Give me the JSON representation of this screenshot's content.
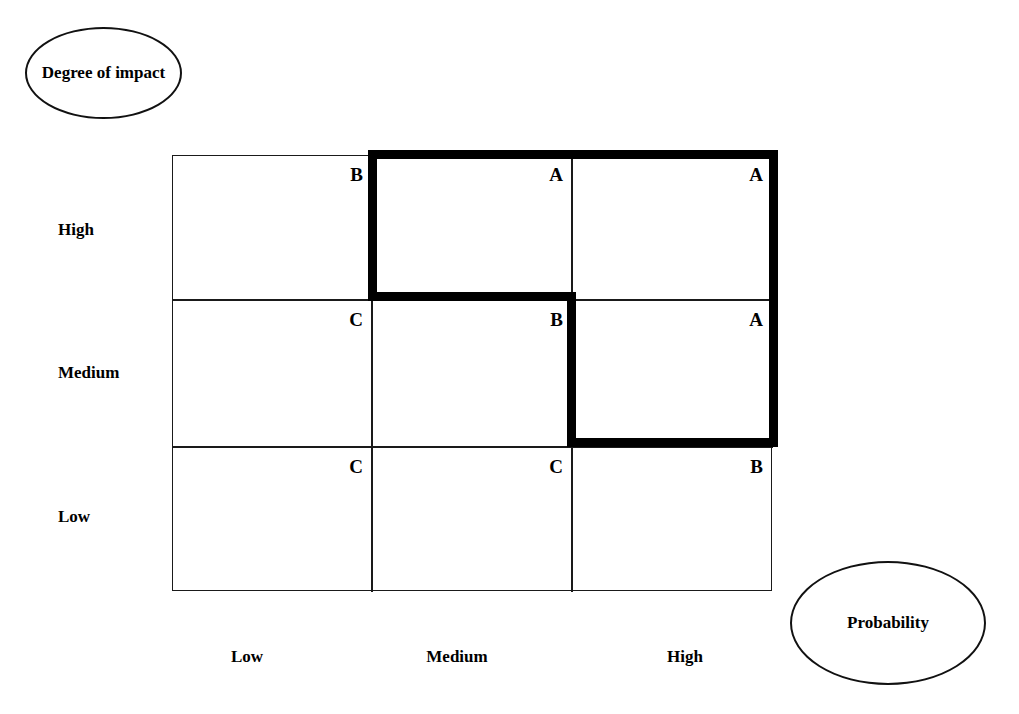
{
  "diagram": {
    "axes": {
      "y": {
        "name": "Degree of impact",
        "categories": [
          "High",
          "Medium",
          "Low"
        ]
      },
      "x": {
        "name": "Probability",
        "categories": [
          "Low",
          "Medium",
          "High"
        ]
      }
    },
    "ellipses": {
      "impact": "Degree of impact",
      "probability": "Probability"
    },
    "cells": [
      {
        "row": "High",
        "col": "Low",
        "rating": "B"
      },
      {
        "row": "High",
        "col": "Medium",
        "rating": "A"
      },
      {
        "row": "High",
        "col": "High",
        "rating": "A"
      },
      {
        "row": "Medium",
        "col": "Low",
        "rating": "C"
      },
      {
        "row": "Medium",
        "col": "Medium",
        "rating": "B"
      },
      {
        "row": "Medium",
        "col": "High",
        "rating": "A"
      },
      {
        "row": "Low",
        "col": "Low",
        "rating": "C"
      },
      {
        "row": "Low",
        "col": "Medium",
        "rating": "C"
      },
      {
        "row": "Low",
        "col": "High",
        "rating": "B"
      }
    ],
    "row_labels": [
      "High",
      "Medium",
      "Low"
    ],
    "col_labels": [
      "Low",
      "Medium",
      "High"
    ],
    "colors": {
      "line": "#1a1a1a",
      "highlight": "#000000",
      "background": "#ffffff",
      "text": "#000000"
    }
  }
}
